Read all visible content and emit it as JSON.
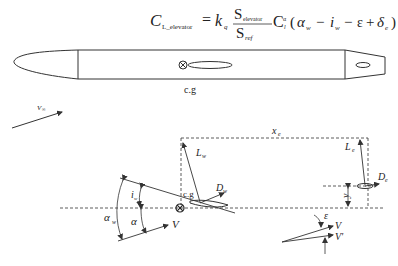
{
  "formula": {
    "lhs": "C",
    "lhs_sub": "L_elevator",
    "equals": "=",
    "k": "k",
    "k_sub": "q",
    "frac_num": "S",
    "frac_num_sub": "elevator",
    "frac_den": "S",
    "frac_den_sub": "ref",
    "cl": "C",
    "cl_sub": "l",
    "cl_sup": "α",
    "paren_open": "(",
    "alpha": "α",
    "alpha_sub": "w",
    "minus1": "−",
    "i": "i",
    "i_sub": "w",
    "minus2": "−",
    "eps": "ε",
    "plus": "+",
    "delta": "δ",
    "delta_sub": "e",
    "paren_close": ")"
  },
  "fuselage": {
    "cg_label": "c.g"
  },
  "labels": {
    "v_inf": "V",
    "v_inf_sub": "∞",
    "x_e": "x",
    "x_e_sub": "e",
    "L_w": "L",
    "L_w_sub": "w",
    "L_e": "L",
    "L_e_sub": "e",
    "D_w": "D",
    "D_w_sub": "w",
    "D_e": "D",
    "D_e_sub": "e",
    "y_e": "y",
    "y_e_sub": "e",
    "cg": "c.g",
    "i_w": "i",
    "i_w_sub": "w",
    "alpha_w": "α",
    "alpha_w_sub": "w",
    "alpha": "α",
    "V": "V",
    "epsilon": "ε",
    "V2": "V",
    "V_prime": "V'",
    "V_prime_mark": "'"
  }
}
